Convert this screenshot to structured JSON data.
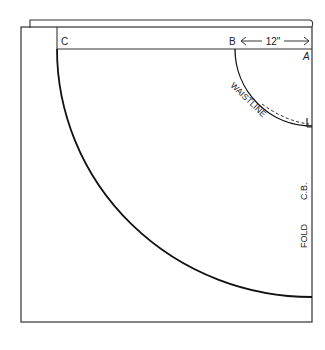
{
  "diagram": {
    "type": "circle-skirt-pattern",
    "labels": {
      "point_a": "A",
      "point_b": "B",
      "point_c": "C",
      "measurement": "12\"",
      "waistline": "WAISTLINE",
      "center_back": "C.B.",
      "fold": "FOLD"
    },
    "colors": {
      "line": "#222222",
      "background": "#ffffff"
    }
  }
}
